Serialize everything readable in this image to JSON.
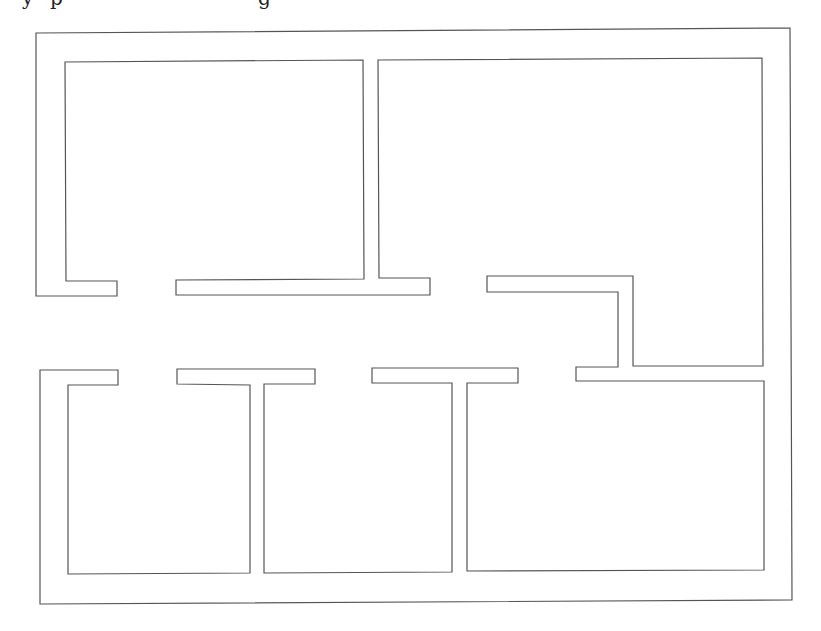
{
  "caption": {
    "fragments": [
      {
        "text": "y",
        "x": 22
      },
      {
        "text": "p",
        "x": 50
      },
      {
        "text": "g",
        "x": 258
      }
    ]
  },
  "diagram": {
    "type": "floor-plan",
    "stroke_color": "#555555",
    "background": "#ffffff",
    "rooms": [
      {
        "name": "top-left-room"
      },
      {
        "name": "top-right-room"
      },
      {
        "name": "bottom-left-room"
      },
      {
        "name": "bottom-middle-room"
      },
      {
        "name": "bottom-right-room"
      }
    ]
  }
}
